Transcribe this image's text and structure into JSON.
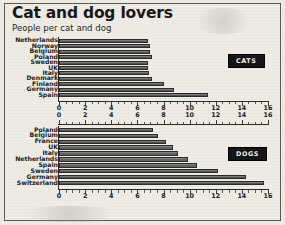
{
  "header": {
    "title": "Cat and dog lovers",
    "subtitle": "People per cat and dog"
  },
  "legend": {
    "cats_label": "CATS",
    "dogs_label": "DOGS"
  },
  "chart_data": [
    {
      "type": "bar",
      "orientation": "horizontal",
      "title": "Cat and dog lovers",
      "subtitle": "People per cat and dog",
      "series_name": "CATS",
      "xlabel": "",
      "ylabel": "",
      "xlim": [
        0,
        16
      ],
      "xticks": [
        0,
        2,
        4,
        6,
        8,
        10,
        12,
        14,
        16
      ],
      "xticklabels": [
        "0",
        "2",
        "4",
        "6",
        "8",
        "10",
        "12",
        "14",
        "16"
      ],
      "grid": false,
      "legend_position": "right",
      "categories": [
        "Netherlands",
        "Norway",
        "Belgium",
        "Poland",
        "Sweden",
        "UK",
        "Italy",
        "Denmark",
        "Finland",
        "Germany",
        "Spain"
      ],
      "values": [
        6.8,
        7.0,
        7.0,
        7.1,
        6.8,
        6.8,
        6.9,
        7.1,
        8.0,
        8.8,
        11.4
      ]
    },
    {
      "type": "bar",
      "orientation": "horizontal",
      "series_name": "DOGS",
      "xlabel": "",
      "ylabel": "",
      "xlim": [
        0,
        16
      ],
      "xticks": [
        0,
        2,
        4,
        6,
        8,
        10,
        12,
        14,
        16
      ],
      "xticklabels": [
        "0",
        "2",
        "4",
        "6",
        "8",
        "10",
        "12",
        "14",
        "16"
      ],
      "grid": false,
      "legend_position": "right",
      "categories": [
        "Poland",
        "Belgium",
        "France",
        "UK",
        "Italy",
        "Netherlands",
        "Spain",
        "Sweden",
        "Germany",
        "Switzerland"
      ],
      "values": [
        7.2,
        7.6,
        8.2,
        8.7,
        9.1,
        9.9,
        10.6,
        12.2,
        14.3,
        15.7
      ]
    }
  ],
  "axis_top": {
    "ticklabels": [
      "0",
      "2",
      "4",
      "6",
      "8",
      "10",
      "12",
      "14",
      "16"
    ]
  }
}
